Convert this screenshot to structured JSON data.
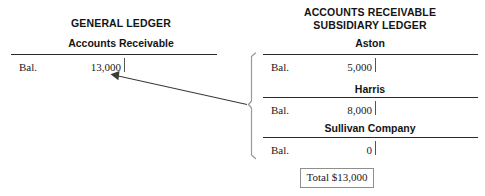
{
  "general_ledger": {
    "title": "GENERAL LEDGER",
    "account_name": "Accounts Receivable",
    "row": {
      "label": "Bal.",
      "amount": "13,000"
    }
  },
  "subsidiary_ledger": {
    "title_line1": "ACCOUNTS RECEIVABLE",
    "title_line2": "SUBSIDIARY LEDGER",
    "accounts": [
      {
        "name": "Aston",
        "label": "Bal.",
        "amount": "5,000"
      },
      {
        "name": "Harris",
        "label": "Bal.",
        "amount": "8,000"
      },
      {
        "name": "Sullivan Company",
        "label": "Bal.",
        "amount": "0"
      }
    ],
    "total_box": "Total $13,000"
  },
  "colors": {
    "rule": "#2b2b2b",
    "text": "#141414",
    "arrow": "#3a3a3a",
    "brace": "#9a9a9a",
    "box_border": "#8e8e8e"
  }
}
